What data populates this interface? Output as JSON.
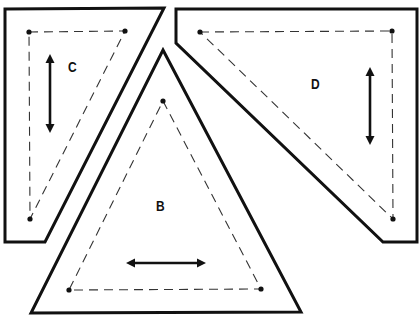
{
  "diagram": {
    "type": "quilt-template-pieces",
    "colors": {
      "line": "#111111",
      "seam": "#333333",
      "background": "#ffffff"
    },
    "pieces": [
      {
        "id": "C",
        "label": "C",
        "shape": "right-triangle-template",
        "grainline": "vertical",
        "outline": "5,9 164,8 45,242 5,242",
        "seam": "29,32 125,31 30,219",
        "dots": [
          [
            29,
            32
          ],
          [
            125,
            31
          ],
          [
            30,
            219
          ]
        ],
        "label_pos": [
          68,
          58
        ],
        "arrow": {
          "x1": 50,
          "y1": 54,
          "x2": 50,
          "y2": 133
        }
      },
      {
        "id": "D",
        "label": "D",
        "shape": "right-triangle-template",
        "grainline": "vertical",
        "outline": "176,9 417,9 417,242 383,242 176,43",
        "seam": "200,32 392,31 393,219",
        "dots": [
          [
            200,
            32
          ],
          [
            392,
            31
          ],
          [
            393,
            219
          ]
        ],
        "label_pos": [
          311,
          75
        ],
        "arrow": {
          "x1": 370,
          "y1": 67,
          "x2": 370,
          "y2": 145
        }
      },
      {
        "id": "B",
        "label": "B",
        "shape": "equilateral-triangle-template",
        "grainline": "horizontal",
        "outline": "163,50 301,312 31,313",
        "seam": "163,101 261,289 69,290",
        "dots": [
          [
            163,
            101
          ],
          [
            261,
            289
          ],
          [
            69,
            290
          ]
        ],
        "label_pos": [
          156,
          197
        ],
        "arrow": {
          "x1": 126,
          "y1": 263,
          "x2": 206,
          "y2": 263
        }
      }
    ]
  }
}
